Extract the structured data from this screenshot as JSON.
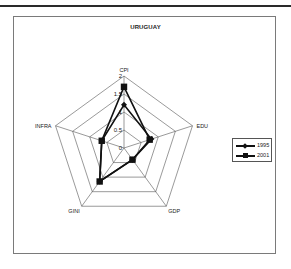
{
  "chart_data": {
    "type": "radar",
    "title": "URUGUAY",
    "categories": [
      "CPI",
      "EDU",
      "GDP",
      "GINI",
      "INFRA"
    ],
    "series": [
      {
        "name": "1995",
        "marker": "diamond",
        "values": [
          1.2,
          0.8,
          0.4,
          1.15,
          0.65
        ]
      },
      {
        "name": "2001",
        "marker": "square",
        "values": [
          1.7,
          0.75,
          0.4,
          1.15,
          0.65
        ]
      }
    ],
    "radial_ticks": [
      "0",
      "0.5",
      "1",
      "1.5",
      "2"
    ],
    "rlim": [
      0,
      2
    ],
    "grid": true,
    "legend_position": "right"
  },
  "legend": {
    "items": [
      {
        "label": "1995"
      },
      {
        "label": "2001"
      }
    ]
  },
  "colors": {
    "series": "#111111",
    "grid": "#555555",
    "frame": "#7a7a7a"
  }
}
